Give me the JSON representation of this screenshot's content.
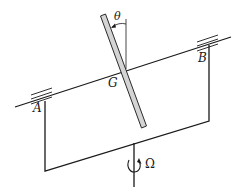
{
  "diagram": {
    "labels": {
      "theta": "θ",
      "G": "G",
      "A": "A",
      "B": "B",
      "Omega": "Ω"
    },
    "colors": {
      "line": "#1a1a1a",
      "rod_fill": "#d4d4d4",
      "rod_stroke": "#2a2a2a"
    }
  }
}
